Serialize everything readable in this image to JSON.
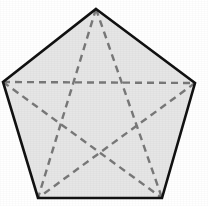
{
  "figure": {
    "name": "regular-pentagon-with-pentagram-diagonals",
    "canvas": {
      "width": 208,
      "height": 206,
      "background_color": "#ffffff"
    },
    "shape": {
      "type": "regular-pentagon",
      "sides": 5,
      "fill_color": "#e6e6e6",
      "outline_color": "#111111",
      "outline_width": 2.6,
      "vertices": [
        {
          "label": "top",
          "x": 96,
          "y": 9
        },
        {
          "label": "right",
          "x": 195,
          "y": 83
        },
        {
          "label": "bottom-right",
          "x": 162,
          "y": 198
        },
        {
          "label": "bottom-left",
          "x": 38,
          "y": 198
        },
        {
          "label": "left",
          "x": 3,
          "y": 82
        }
      ]
    },
    "diagonals": {
      "count": 5,
      "style": "dashed",
      "stroke_color": "#787878",
      "stroke_width": 2.4,
      "dash_length": 7,
      "dash_gap": 5,
      "segments": [
        {
          "from": "top",
          "to": "bottom-left"
        },
        {
          "from": "top",
          "to": "bottom-right"
        },
        {
          "from": "left",
          "to": "right"
        },
        {
          "from": "left",
          "to": "bottom-right"
        },
        {
          "from": "right",
          "to": "bottom-left"
        }
      ]
    }
  }
}
